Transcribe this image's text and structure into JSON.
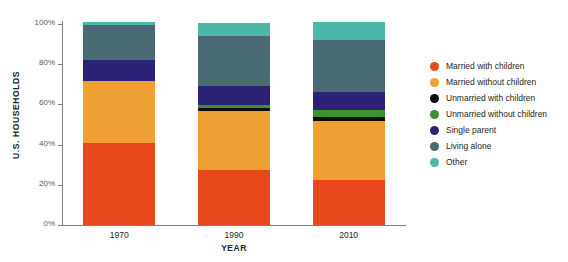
{
  "chart_data": {
    "type": "bar",
    "title": "",
    "subtitle": "",
    "stacked": true,
    "xlabel": "YEAR",
    "ylabel": "U.S. HOUSEHOLDS",
    "categories": [
      "1970",
      "1990",
      "2010"
    ],
    "ylim": [
      0,
      100
    ],
    "yticks": [
      0,
      20,
      40,
      60,
      80,
      100
    ],
    "ytick_labels": [
      "0%",
      "20%",
      "40%",
      "60%",
      "80%",
      "100%"
    ],
    "grid": false,
    "legend_position": "right",
    "units": "percent",
    "series": [
      {
        "name": "Married with children",
        "color": "#e8481c",
        "values": [
          41.0,
          27.4,
          22.4
        ]
      },
      {
        "name": "Married without children",
        "color": "#efa033",
        "values": [
          30.5,
          29.1,
          29.3
        ]
      },
      {
        "name": "Unmarried with children",
        "color": "#0d0d0d",
        "values": [
          0.0,
          1.5,
          1.8
        ]
      },
      {
        "name": "Unmarried without children",
        "color": "#3f9130",
        "values": [
          0.0,
          1.5,
          3.5
        ]
      },
      {
        "name": "Single parent",
        "color": "#2b2275",
        "values": [
          10.5,
          9.5,
          9.0
        ]
      },
      {
        "name": "Living alone",
        "color": "#4a6a73",
        "values": [
          17.5,
          25.0,
          26.0
        ]
      },
      {
        "name": "Other",
        "color": "#4bb8a9",
        "values": [
          1.5,
          6.5,
          9.0
        ]
      }
    ]
  },
  "legend": {
    "items": [
      {
        "label": "Married with children",
        "color": "#e8481c"
      },
      {
        "label": "Married without children",
        "color": "#efa033"
      },
      {
        "label": "Unmarried with children",
        "color": "#0d0d0d"
      },
      {
        "label": "Unmarried without children",
        "color": "#3f9130"
      },
      {
        "label": "Single parent",
        "color": "#2b2275"
      },
      {
        "label": "Living alone",
        "color": "#4a6a73"
      },
      {
        "label": "Other",
        "color": "#4bb8a9"
      }
    ]
  },
  "axes": {
    "y_title": "U.S. HOUSEHOLDS",
    "x_title": "YEAR",
    "axis_color": "#808184",
    "tick_text_color": "#58595b"
  }
}
